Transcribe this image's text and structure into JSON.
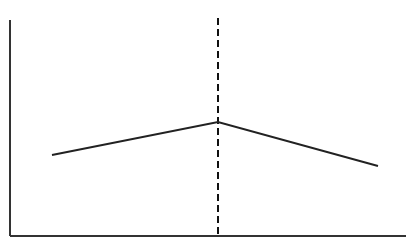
{
  "chart_data": {
    "type": "line",
    "title": "",
    "xlabel": "",
    "ylabel": "",
    "grid": false,
    "legend": null,
    "x": [
      0,
      1,
      2
    ],
    "series": [
      {
        "name": "",
        "values": [
          0.38,
          0.53,
          0.32
        ],
        "color": "#222222"
      }
    ],
    "annotations": [
      {
        "type": "vline",
        "x": 1,
        "style": "dashed",
        "color": "#111111"
      }
    ],
    "xlim": [
      -0.25,
      2.15
    ],
    "ylim": [
      0,
      1
    ],
    "axes": {
      "x_ticks": [],
      "y_ticks": [],
      "color": "#333333"
    },
    "pixel_geometry": {
      "origin": [
        10,
        236
      ],
      "x_axis_end": 406,
      "y_axis_top": 20,
      "points": [
        [
          52,
          155
        ],
        [
          218,
          122
        ],
        [
          378,
          166
        ]
      ],
      "vline": {
        "x": 218,
        "y1": 18,
        "y2": 236
      }
    }
  }
}
